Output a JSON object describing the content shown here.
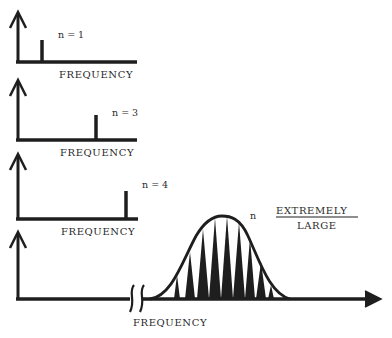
{
  "diagram": {
    "panels": [
      {
        "n_label": "n = 1",
        "x_axis_label": "FREQUENCY"
      },
      {
        "n_label": "n = 3",
        "x_axis_label": "FREQUENCY"
      },
      {
        "n_label": "n = 4",
        "x_axis_label": "FREQUENCY"
      },
      {
        "n_label": "n",
        "n_value_top": "EXTREMELY",
        "n_value_bottom": "LARGE",
        "x_axis_label": "FREQUENCY"
      }
    ],
    "colors": {
      "ink": "#1e1e1e",
      "background": "#ffffff"
    }
  }
}
